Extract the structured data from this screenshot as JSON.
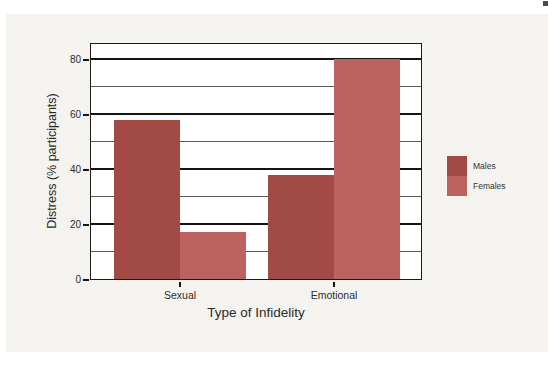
{
  "chart_data": {
    "type": "bar",
    "title": "",
    "xlabel": "Type of Infidelity",
    "ylabel": "Distress (% participants)",
    "categories": [
      "Sexual",
      "Emotional"
    ],
    "series": [
      {
        "name": "Males",
        "color": "#a14a46",
        "values": [
          58,
          38
        ]
      },
      {
        "name": "Females",
        "color": "#bc6361",
        "values": [
          17,
          80
        ]
      }
    ],
    "ylim": [
      0,
      85
    ],
    "yticks_major": [
      0,
      20,
      40,
      60,
      80
    ],
    "yticks_minor": [
      10,
      30,
      50,
      70
    ],
    "grid": true,
    "grid_orientation": "horizontal",
    "legend_position": "right",
    "legend_entries": [
      "Males",
      "Females"
    ]
  },
  "colors": {
    "panel_background": "#f4f3ef",
    "plot_background": "#ffffff",
    "grid_major": "#141414",
    "grid_minor": "#5a5a5a",
    "frame": "#1a1a1a",
    "text": "#2e2e2e"
  }
}
